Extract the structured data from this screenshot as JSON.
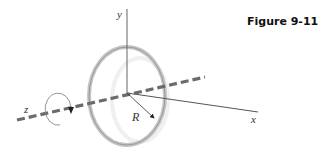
{
  "figure": {
    "title": "Figure 9-11",
    "labels": {
      "y_axis": "y",
      "x_axis": "x",
      "z_axis": "z",
      "radius": "R"
    },
    "elements": [
      "ring of radius R centered at origin",
      "rotation arrow about z-axis",
      "dashed z-axis"
    ],
    "colors": {
      "ring": "#b8b8b8",
      "axis": "#555555",
      "dashed_axis": "#666666",
      "arrow": "#222222"
    }
  }
}
